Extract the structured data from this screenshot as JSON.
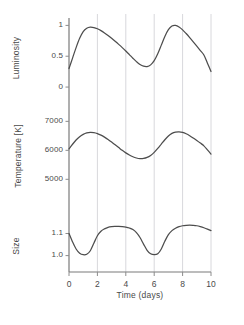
{
  "chart_data": {
    "type": "line",
    "title": "",
    "subtitle": "",
    "xlabel": "Time (days)",
    "ylabel": "",
    "grid": true,
    "grid_axis": "x",
    "legend": false,
    "legend_position": "none",
    "line_color": "#4d4d4d",
    "grid_color": "#d8d8dc",
    "axis_color": "#8c8c8c",
    "spine_color": "#7a7a7a",
    "x": [
      0,
      0.25,
      0.5,
      0.75,
      1,
      1.25,
      1.5,
      1.75,
      2,
      2.25,
      2.5,
      2.75,
      3,
      3.25,
      3.5,
      3.75,
      4,
      4.25,
      4.5,
      4.75,
      5,
      5.25,
      5.5,
      5.75,
      6,
      6.25,
      6.5,
      6.75,
      7,
      7.25,
      7.5,
      7.75,
      8,
      8.25,
      8.5,
      8.75,
      9,
      9.25,
      9.5,
      9.75,
      10
    ],
    "xlim": [
      0,
      10
    ],
    "xticks": [
      0,
      2,
      4,
      6,
      8,
      10
    ],
    "xticklabels": [
      "0",
      "2",
      "4",
      "6",
      "8",
      "10"
    ],
    "panels": [
      {
        "id": "luminosity",
        "ylabel": "Luminosity",
        "ylim": [
          -0.08,
          1.12
        ],
        "yticks": [
          0,
          0.5,
          1
        ],
        "yticklabels": [
          "0",
          "0.5",
          "1"
        ],
        "values": [
          0.3,
          0.47,
          0.64,
          0.79,
          0.9,
          0.955,
          0.972,
          0.965,
          0.945,
          0.915,
          0.878,
          0.836,
          0.79,
          0.742,
          0.692,
          0.64,
          0.585,
          0.527,
          0.468,
          0.412,
          0.365,
          0.338,
          0.333,
          0.36,
          0.428,
          0.54,
          0.68,
          0.82,
          0.93,
          0.99,
          1.0,
          0.975,
          0.928,
          0.868,
          0.802,
          0.733,
          0.663,
          0.592,
          0.52,
          0.388,
          0.252
        ]
      },
      {
        "id": "temperature",
        "ylabel": "Temperature [K]",
        "ylim": [
          4700,
          7150
        ],
        "yticks": [
          5000,
          6000,
          7000
        ],
        "yticklabels": [
          "5000",
          "6000",
          "7000"
        ],
        "values": [
          6050,
          6210,
          6355,
          6470,
          6550,
          6600,
          6620,
          6610,
          6578,
          6525,
          6455,
          6375,
          6285,
          6190,
          6095,
          6000,
          5912,
          5838,
          5778,
          5736,
          5715,
          5720,
          5755,
          5825,
          5930,
          6065,
          6215,
          6365,
          6495,
          6585,
          6630,
          6640,
          6620,
          6572,
          6505,
          6425,
          6340,
          6250,
          6155,
          6015,
          5870
        ]
      },
      {
        "id": "size",
        "ylabel": "Size",
        "ylim": [
          0.962,
          1.152
        ],
        "yticks": [
          1.0,
          1.1
        ],
        "yticklabels": [
          "1.0",
          "1.1"
        ],
        "values": [
          1.1,
          1.062,
          1.03,
          1.011,
          1.004,
          1.006,
          1.022,
          1.056,
          1.09,
          1.11,
          1.121,
          1.128,
          1.131,
          1.132,
          1.132,
          1.131,
          1.129,
          1.125,
          1.118,
          1.104,
          1.082,
          1.052,
          1.024,
          1.008,
          1.004,
          1.008,
          1.03,
          1.065,
          1.095,
          1.113,
          1.124,
          1.131,
          1.135,
          1.137,
          1.138,
          1.137,
          1.135,
          1.131,
          1.126,
          1.12,
          1.113
        ]
      }
    ]
  }
}
